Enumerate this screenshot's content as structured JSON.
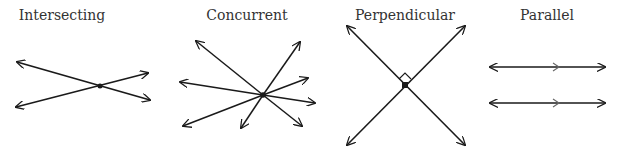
{
  "panels": [
    {
      "id": "intersecting",
      "label": "Intersecting",
      "label_x": 62
    },
    {
      "id": "concurrent",
      "label": "Concurrent",
      "label_x": 247
    },
    {
      "id": "perpendicular",
      "label": "Perpendicular",
      "label_x": 405
    },
    {
      "id": "parallel",
      "label": "Parallel",
      "label_x": 547
    }
  ],
  "colors": {
    "line": "#1a1a1a",
    "text": "#333333",
    "background": "#ffffff"
  }
}
